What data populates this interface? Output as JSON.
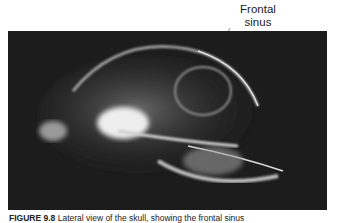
{
  "figure": {
    "annotation_label": "Frontal\nsinus",
    "annotation_label_line1": "Frontal",
    "annotation_label_line2": "sinus",
    "caption_label": "FIGURE 9.8",
    "caption_text": "Lateral view of the skull, showing the frontal sinus",
    "image_description": "Lateral radiograph of a cat skull",
    "colors": {
      "background": "#1a1a1a",
      "bone": "#e6e6e6",
      "text": "#222222"
    }
  }
}
